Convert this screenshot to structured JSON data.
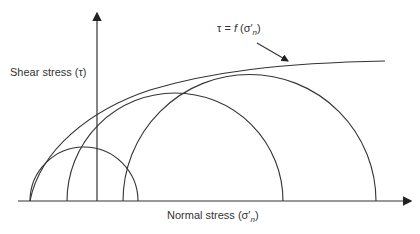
{
  "diagram": {
    "type": "Mohr circles with failure envelope",
    "y_axis_label": "Shear stress (τ)",
    "x_axis_label_prefix": "Normal stress (σ",
    "x_axis_label_sub": "n",
    "x_axis_label_suffix": ")",
    "envelope_label_prefix": "τ = ",
    "envelope_label_func": "f",
    "envelope_label_arg": " (σ",
    "envelope_label_sub": "n",
    "envelope_label_suffix": ")",
    "stroke_color": "#333333",
    "circles": [
      {
        "name": "small",
        "left": 30,
        "right": 138
      },
      {
        "name": "medium",
        "left": 67,
        "right": 283
      },
      {
        "name": "large",
        "left": 123,
        "right": 376
      }
    ]
  }
}
